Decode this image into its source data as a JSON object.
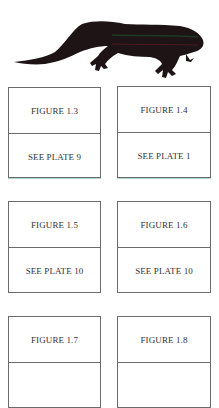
{
  "header_image": {
    "icon": "lizard-silhouette-icon",
    "colors": {
      "body": "#1e1416",
      "stripe_green": "#1f3a22",
      "stripe_red": "#4a1a20"
    }
  },
  "figures": [
    {
      "label": "FIGURE 1.3",
      "caption": "SEE PLATE 9"
    },
    {
      "label": "FIGURE 1.4",
      "caption": "SEE PLATE 1"
    },
    {
      "label": "FIGURE 1.5",
      "caption": "SEE PLATE 10"
    },
    {
      "label": "FIGURE 1.6",
      "caption": "SEE PLATE 10"
    },
    {
      "label": "FIGURE 1.7",
      "caption": ""
    },
    {
      "label": "FIGURE 1.8",
      "caption": ""
    }
  ]
}
